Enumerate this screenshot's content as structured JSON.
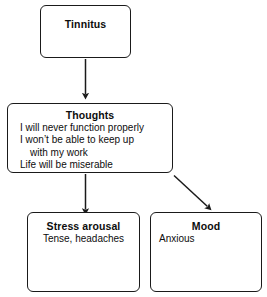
{
  "diagram": {
    "type": "flowchart",
    "background_color": "#ffffff",
    "stroke_color": "#1a1a1a",
    "text_color": "#0d0d0d",
    "nodes": [
      {
        "id": "tinnitus",
        "title": "Tinnitus",
        "lines": []
      },
      {
        "id": "thoughts",
        "title": "Thoughts",
        "lines": [
          "I will never function properly",
          "I won’t be able to keep up",
          "with my work",
          "Life will be miserable"
        ]
      },
      {
        "id": "stress_arousal",
        "title": "Stress arousal",
        "lines": [
          "Tense, headaches"
        ]
      },
      {
        "id": "mood",
        "title": "Mood",
        "lines": [
          "Anxious"
        ]
      }
    ],
    "edges": [
      {
        "id": "tinnitus-to-thoughts",
        "from": "tinnitus",
        "to": "thoughts",
        "style": "vertical-arrow"
      },
      {
        "id": "thoughts-to-stress",
        "from": "thoughts",
        "to": "stress_arousal",
        "style": "vertical-arrow"
      },
      {
        "id": "thoughts-to-mood",
        "from": "thoughts",
        "to": "mood",
        "style": "diagonal-arrow"
      }
    ]
  }
}
